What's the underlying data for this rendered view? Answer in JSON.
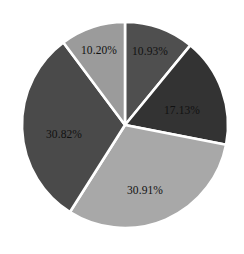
{
  "chart_data": {
    "type": "pie",
    "title": "",
    "subtitle": "",
    "xlabel": "",
    "ylabel": "",
    "grid": false,
    "legend": "none",
    "start_angle_deg": 0,
    "direction": "clockwise",
    "background_color": "#ffffff",
    "separator_color": "#ffffff",
    "label_color": "#111111",
    "categories": [
      "10.93%",
      "17.13%",
      "30.91%",
      "30.82%",
      "10.20%"
    ],
    "values": [
      10.93,
      17.13,
      30.91,
      30.82,
      10.2
    ],
    "total": 99.99,
    "slices": [
      {
        "label": "10.93%",
        "value": 10.93,
        "color": "#4f4f4f",
        "start_deg": 0.0,
        "end_deg": 39.35,
        "label_x": 150,
        "label_y": 51
      },
      {
        "label": "17.13%",
        "value": 17.13,
        "color": "#333333",
        "start_deg": 39.35,
        "end_deg": 101.02,
        "label_x": 182,
        "label_y": 110
      },
      {
        "label": "30.91%",
        "value": 30.91,
        "color": "#a8a8a8",
        "start_deg": 101.02,
        "end_deg": 212.3,
        "label_x": 145,
        "label_y": 190
      },
      {
        "label": "30.82%",
        "value": 30.82,
        "color": "#4a4a4a",
        "start_deg": 212.3,
        "end_deg": 323.25,
        "label_x": 64,
        "label_y": 134
      },
      {
        "label": "10.20%",
        "value": 10.2,
        "color": "#9b9b9b",
        "start_deg": 323.25,
        "end_deg": 360.0,
        "label_x": 99,
        "label_y": 50
      }
    ],
    "geometry": {
      "center_x": 125,
      "center_y": 125,
      "radius": 103
    }
  }
}
